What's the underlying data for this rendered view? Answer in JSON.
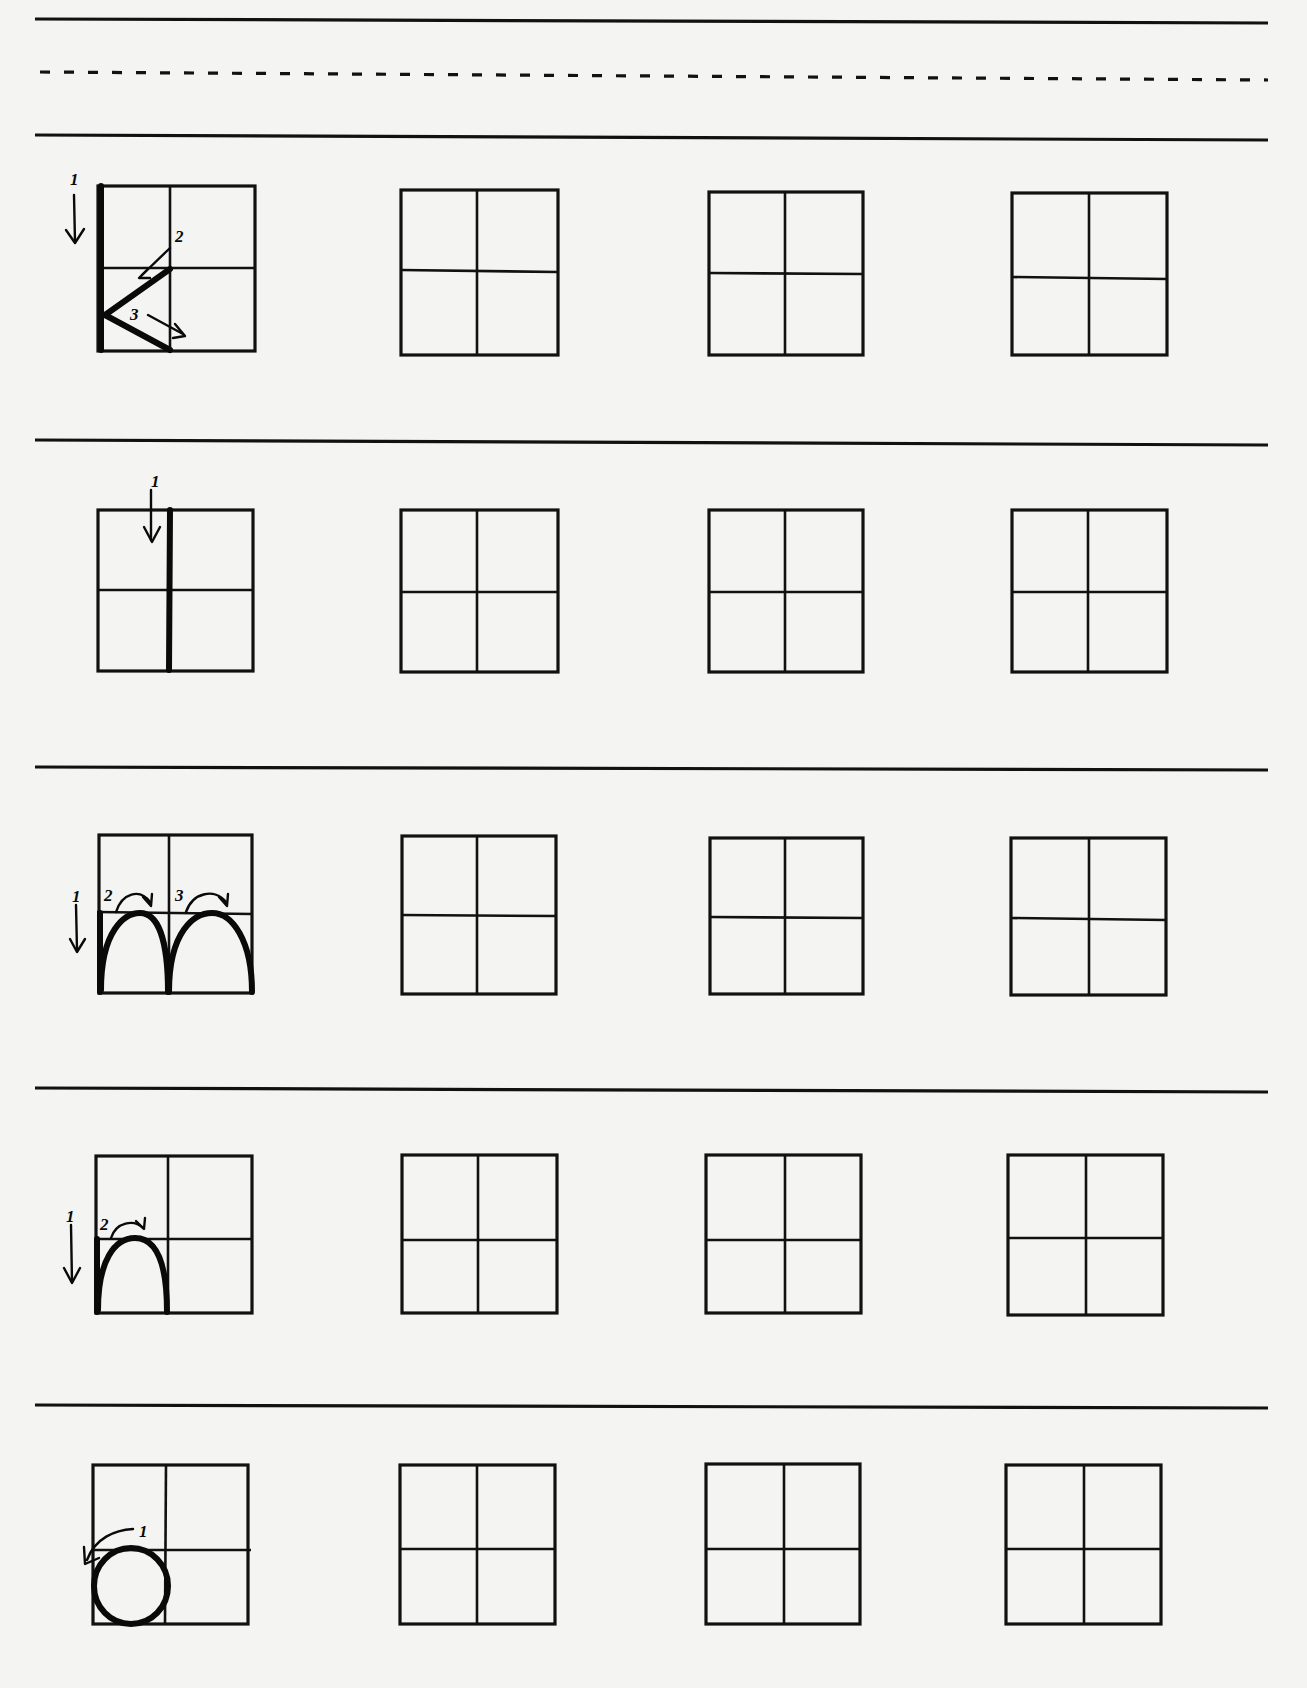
{
  "worksheet": {
    "header": {
      "lines": [
        "solid",
        "dashed",
        "solid"
      ]
    },
    "rows": [
      {
        "example_letter_shape": "k",
        "strokes": [
          {
            "order": "1",
            "direction": "down",
            "label": "1"
          },
          {
            "order": "2",
            "direction": "down-left diagonal",
            "label": "2"
          },
          {
            "order": "3",
            "direction": "down-right diagonal",
            "label": "3"
          }
        ],
        "practice_boxes": 3
      },
      {
        "example_letter_shape": "l",
        "strokes": [
          {
            "order": "1",
            "direction": "down",
            "label": "1"
          }
        ],
        "practice_boxes": 3
      },
      {
        "example_letter_shape": "m",
        "strokes": [
          {
            "order": "1",
            "direction": "down",
            "label": "1"
          },
          {
            "order": "2",
            "direction": "arch right",
            "label": "2"
          },
          {
            "order": "3",
            "direction": "arch right",
            "label": "3"
          }
        ],
        "practice_boxes": 3
      },
      {
        "example_letter_shape": "n",
        "strokes": [
          {
            "order": "1",
            "direction": "down",
            "label": "1"
          },
          {
            "order": "2",
            "direction": "arch right",
            "label": "2"
          }
        ],
        "practice_boxes": 3
      },
      {
        "example_letter_shape": "o",
        "strokes": [
          {
            "order": "1",
            "direction": "counter-clockwise circle",
            "label": "1"
          }
        ],
        "practice_boxes": 3
      }
    ]
  }
}
